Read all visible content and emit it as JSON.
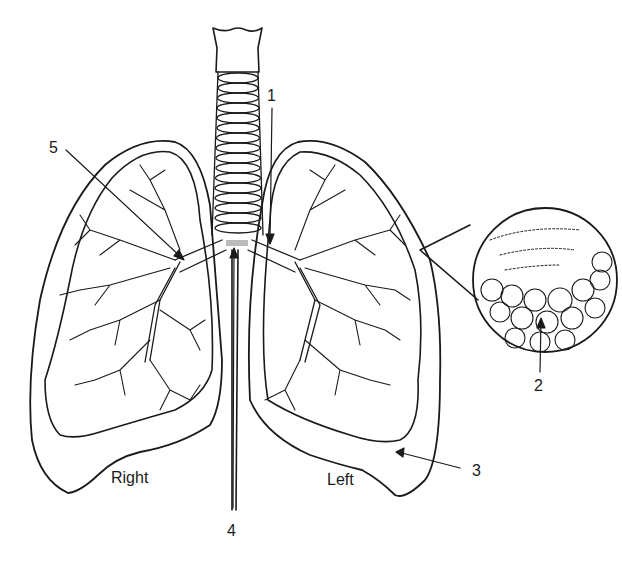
{
  "diagram": {
    "labels": {
      "l1": "1",
      "l2": "2",
      "l3": "3",
      "l4": "4",
      "l5": "5",
      "right": "Right",
      "left": "Left"
    },
    "colors": {
      "stroke": "#1a1a1a",
      "background": "#ffffff"
    }
  }
}
